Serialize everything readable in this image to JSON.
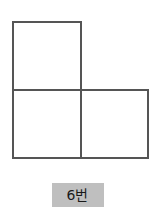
{
  "figure": {
    "name": "L-tromino-net",
    "background_color": "#ffffff",
    "stroke_color": "#555555",
    "fill_color": "#ffffff",
    "stroke_width": 2,
    "square_size": 68,
    "squares": [
      {
        "name": "top-left-square",
        "x": 13,
        "y": 22,
        "w": 68,
        "h": 68
      },
      {
        "name": "bottom-left-square",
        "x": 13,
        "y": 90,
        "w": 68,
        "h": 68
      },
      {
        "name": "bottom-right-square",
        "x": 81,
        "y": 90,
        "w": 67,
        "h": 68
      }
    ],
    "bounds": {
      "x": 13,
      "y": 22,
      "w": 135,
      "h": 136
    }
  },
  "label": {
    "text": "6번",
    "background_color": "#bfbfbf",
    "text_color": "#1a1a1a",
    "box": {
      "x": 52,
      "y": 183,
      "w": 52,
      "h": 24
    }
  }
}
